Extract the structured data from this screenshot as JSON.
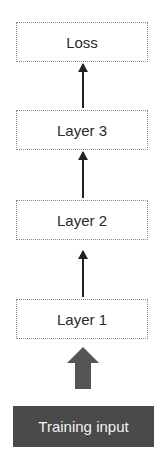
{
  "diagram": {
    "nodes": [
      {
        "id": "loss",
        "label": "Loss"
      },
      {
        "id": "layer3",
        "label": "Layer 3"
      },
      {
        "id": "layer2",
        "label": "Layer 2"
      },
      {
        "id": "layer1",
        "label": "Layer 1"
      }
    ],
    "input": {
      "label": "Training input"
    },
    "edges": [
      {
        "from": "layer3",
        "to": "loss"
      },
      {
        "from": "layer2",
        "to": "layer3"
      },
      {
        "from": "layer1",
        "to": "layer2"
      },
      {
        "from": "training-input",
        "to": "layer1",
        "style": "block-arrow"
      }
    ],
    "colors": {
      "box_border": "#8a8a8a",
      "arrow": "#222222",
      "input_fill": "#4a4a4a",
      "input_text": "#f2f2f2",
      "block_arrow": "#555555"
    }
  }
}
